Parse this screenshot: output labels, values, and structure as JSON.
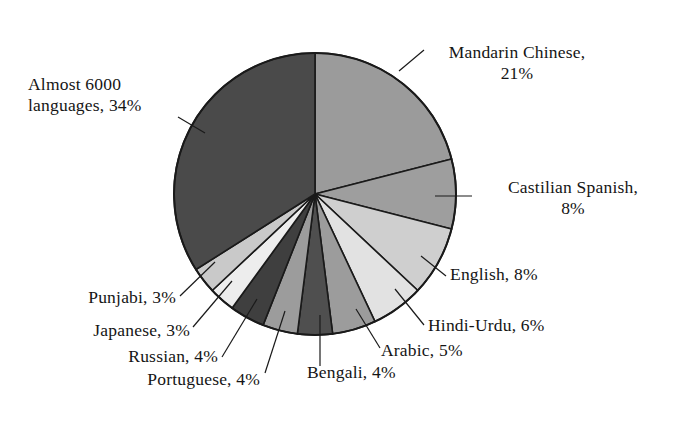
{
  "chart_data": {
    "type": "pie",
    "title": "",
    "subtitle": "",
    "xlabel": "",
    "ylabel": "",
    "legend_position": "none",
    "grid": false,
    "units": "percent",
    "total": 100,
    "categories": [
      "Mandarin Chinese",
      "Castilian Spanish",
      "English",
      "Hindi-Urdu",
      "Arabic",
      "Bengali",
      "Portuguese",
      "Russian",
      "Japanese",
      "Punjabi",
      "Almost 6000 languages"
    ],
    "values": [
      21,
      8,
      8,
      6,
      5,
      4,
      4,
      4,
      3,
      3,
      34
    ],
    "slices": [
      {
        "name": "Mandarin Chinese",
        "value": 21,
        "label": "Mandarin Chinese,\n21%",
        "color": "#9b9b9b"
      },
      {
        "name": "Castilian Spanish",
        "value": 8,
        "label": "Castilian Spanish,\n8%",
        "color": "#9e9e9e"
      },
      {
        "name": "English",
        "value": 8,
        "label": "English, 8%",
        "color": "#cfcfcf"
      },
      {
        "name": "Hindi-Urdu",
        "value": 6,
        "label": "Hindi-Urdu, 6%",
        "color": "#e2e2e2"
      },
      {
        "name": "Arabic",
        "value": 5,
        "label": "Arabic, 5%",
        "color": "#9c9c9c"
      },
      {
        "name": "Bengali",
        "value": 4,
        "label": "Bengali, 4%",
        "color": "#4f4f4f"
      },
      {
        "name": "Portuguese",
        "value": 4,
        "label": "Portuguese, 4%",
        "color": "#9c9c9c"
      },
      {
        "name": "Russian",
        "value": 4,
        "label": "Russian, 4%",
        "color": "#3f3f3f"
      },
      {
        "name": "Japanese",
        "value": 3,
        "label": "Japanese, 3%",
        "color": "#ededed"
      },
      {
        "name": "Punjabi",
        "value": 3,
        "label": "Punjabi, 3%",
        "color": "#c9c9c9"
      },
      {
        "name": "Almost 6000 languages",
        "value": 34,
        "label": "Almost 6000\nlanguages, 34%",
        "color": "#4a4a4a"
      }
    ],
    "extra_wedges": [
      {
        "name": "punjabi-wedge-mid",
        "color": "#6f6f6f"
      },
      {
        "name": "punjabi-wedge-out",
        "color": "#8c8c8c"
      }
    ],
    "stroke_color": "#1a1a1a",
    "background_color": "#ffffff"
  },
  "labels": {
    "mandarin": "Mandarin Chinese,\n21%",
    "castilian": "Castilian Spanish,\n8%",
    "english": "English, 8%",
    "hindi": "Hindi-Urdu, 6%",
    "arabic": "Arabic, 5%",
    "bengali": "Bengali, 4%",
    "portuguese": "Portuguese, 4%",
    "russian": "Russian, 4%",
    "japanese": "Japanese, 3%",
    "punjabi": "Punjabi, 3%",
    "almost": "Almost 6000\nlanguages, 34%"
  }
}
